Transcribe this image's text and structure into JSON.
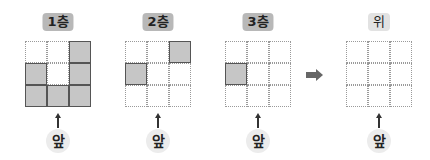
{
  "panels": [
    {
      "label": "1층",
      "kind": "layer",
      "left": 25,
      "grid": [
        [
          0,
          0,
          1
        ],
        [
          1,
          0,
          1
        ],
        [
          1,
          1,
          1
        ]
      ],
      "front_label": "앞"
    },
    {
      "label": "2층",
      "kind": "layer",
      "left": 125,
      "grid": [
        [
          0,
          0,
          1
        ],
        [
          1,
          0,
          0
        ],
        [
          0,
          0,
          0
        ]
      ],
      "front_label": "앞"
    },
    {
      "label": "3층",
      "kind": "layer",
      "left": 225,
      "grid": [
        [
          0,
          0,
          0
        ],
        [
          1,
          0,
          0
        ],
        [
          0,
          0,
          0
        ]
      ],
      "front_label": "앞"
    },
    {
      "label": "위",
      "kind": "top-view",
      "left": 346,
      "grid": [
        [
          0,
          0,
          0
        ],
        [
          0,
          0,
          0
        ],
        [
          0,
          0,
          0
        ]
      ],
      "front_label": "앞"
    }
  ],
  "connector": {
    "icon": "right-arrow-icon",
    "color": "#666666"
  },
  "colors": {
    "filled_cell": "#c6c6c6",
    "filled_border": "#555555",
    "empty_border": "#9a9a9a",
    "layer_label_bg": "#b8b8b8",
    "top_label_bg": "#e2e2e2"
  }
}
